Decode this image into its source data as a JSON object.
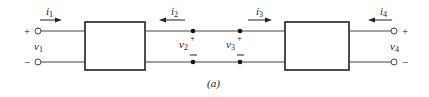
{
  "caption": "(a)",
  "currents": {
    "i1": {
      "label": "i",
      "sub": "1",
      "direction": "right"
    },
    "i2": {
      "label": "i",
      "sub": "2",
      "direction": "left"
    },
    "i3": {
      "label": "i",
      "sub": "3",
      "direction": "right"
    },
    "i4": {
      "label": "i",
      "sub": "4",
      "direction": "left"
    }
  },
  "voltages": {
    "v1": {
      "label": "v",
      "sub": "1"
    },
    "v2": {
      "label": "v",
      "sub": "2"
    },
    "v3": {
      "label": "v",
      "sub": "3"
    },
    "v4": {
      "label": "v",
      "sub": "4"
    }
  },
  "polarity": {
    "plus": "+",
    "minus": "−"
  },
  "colors": {
    "line": "#222222",
    "background": "#ffffff"
  }
}
